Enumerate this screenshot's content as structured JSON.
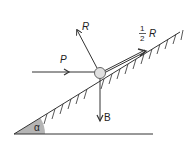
{
  "diagram": {
    "type": "physics-force-diagram",
    "colors": {
      "line": "#333333",
      "ball_fill": "#e0e0e0",
      "wedge_fill": "#b5b5b5"
    },
    "labels": {
      "push_force": "P",
      "normal_force": "R",
      "friction_fraction_num": "1",
      "friction_fraction_den": "2",
      "friction_force": "R",
      "weight": "B",
      "angle": "α"
    }
  }
}
